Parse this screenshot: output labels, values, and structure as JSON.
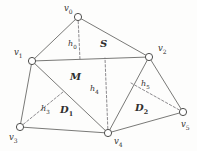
{
  "figure": {
    "type": "planar-graph-diagram",
    "background_color": "#fdfdfc",
    "edge_color": "#6a6a68",
    "dashed_color": "#77757a",
    "node_fill": "#ffffff",
    "node_stroke": "#4f4f4d",
    "width": 197,
    "height": 151
  },
  "vertices": [
    {
      "id": "v0",
      "base": "v",
      "index": "0",
      "cx": 78,
      "cy": 17,
      "r": 3.6,
      "label_x": 64,
      "label_y": 4
    },
    {
      "id": "v1",
      "base": "v",
      "index": "1",
      "cx": 32,
      "cy": 61,
      "r": 3.6,
      "label_x": 14,
      "label_y": 48
    },
    {
      "id": "v2",
      "base": "v",
      "index": "2",
      "cx": 149,
      "cy": 57,
      "r": 3.6,
      "label_x": 158,
      "label_y": 44
    },
    {
      "id": "v3",
      "base": "v",
      "index": "3",
      "cx": 20,
      "cy": 127,
      "r": 3.6,
      "label_x": 9,
      "label_y": 133
    },
    {
      "id": "v4",
      "base": "v",
      "index": "4",
      "cx": 108,
      "cy": 133,
      "r": 3.6,
      "label_x": 114,
      "label_y": 137
    },
    {
      "id": "v5",
      "base": "v",
      "index": "5",
      "cx": 183,
      "cy": 112,
      "r": 3.6,
      "label_x": 181,
      "label_y": 120
    }
  ],
  "edges": [
    {
      "name": "edge-v0-v1",
      "from": "v0",
      "to": "v1"
    },
    {
      "name": "edge-v0-v2",
      "from": "v0",
      "to": "v2"
    },
    {
      "name": "edge-v1-v2",
      "from": "v1",
      "to": "v2"
    },
    {
      "name": "edge-v1-v3",
      "from": "v1",
      "to": "v3"
    },
    {
      "name": "edge-v1-v4",
      "from": "v1",
      "to": "v4"
    },
    {
      "name": "edge-v2-v4",
      "from": "v2",
      "to": "v4"
    },
    {
      "name": "edge-v2-v5",
      "from": "v2",
      "to": "v5"
    },
    {
      "name": "edge-v3-v4",
      "from": "v3",
      "to": "v4"
    },
    {
      "name": "edge-v4-v5",
      "from": "v4",
      "to": "v5"
    }
  ],
  "height_lines": [
    {
      "name": "height-h0",
      "id": "h0",
      "base": "h",
      "index": "0",
      "x1": 78,
      "y1": 17,
      "x2": 80,
      "y2": 60,
      "label_x": 68,
      "label_y": 40
    },
    {
      "name": "height-h3",
      "id": "h3",
      "base": "h",
      "index": "3",
      "x1": 20,
      "y1": 127,
      "x2": 63,
      "y2": 92,
      "label_x": 41,
      "label_y": 105
    },
    {
      "name": "height-h4",
      "id": "h4",
      "base": "h",
      "index": "4",
      "x1": 108,
      "y1": 133,
      "x2": 105,
      "y2": 58,
      "label_x": 90,
      "label_y": 85
    },
    {
      "name": "height-h5",
      "id": "h5",
      "base": "h",
      "index": "5",
      "x1": 183,
      "y1": 112,
      "x2": 131,
      "y2": 83,
      "label_x": 141,
      "label_y": 80
    }
  ],
  "region_labels": [
    {
      "name": "region-S",
      "id": "S",
      "base": "S",
      "index": "",
      "x": 100,
      "y": 39
    },
    {
      "name": "region-M",
      "id": "M",
      "base": "M",
      "index": "",
      "x": 70,
      "y": 72
    },
    {
      "name": "region-D1",
      "id": "D1",
      "base": "D",
      "index": "1",
      "x": 60,
      "y": 105
    },
    {
      "name": "region-D2",
      "id": "D2",
      "base": "D",
      "index": "2",
      "x": 135,
      "y": 103
    }
  ]
}
